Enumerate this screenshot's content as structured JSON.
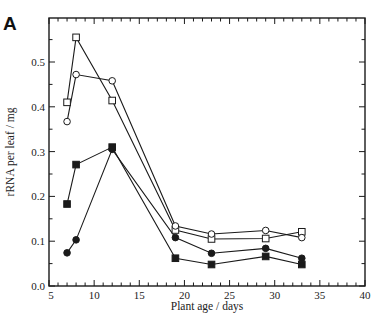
{
  "chart_data": {
    "type": "line",
    "panel_label": "A",
    "title": "",
    "xlabel": "Plant age / days",
    "ylabel": "rRNA per leaf / mg",
    "xlim": [
      5,
      40
    ],
    "ylim": [
      0.0,
      0.6
    ],
    "x_ticks": [
      5,
      10,
      15,
      20,
      25,
      30,
      35,
      40
    ],
    "y_ticks": [
      0.0,
      0.1,
      0.2,
      0.3,
      0.4,
      0.5
    ],
    "x_tick_labels": [
      "5",
      "10",
      "15",
      "20",
      "25",
      "30",
      "35",
      "40"
    ],
    "y_tick_labels": [
      "0.0",
      "0.1",
      "0.2",
      "0.3",
      "0.4",
      "0.5"
    ],
    "grid": false,
    "legend": null,
    "series": [
      {
        "name": "open squares",
        "marker": "square-open",
        "x": [
          7,
          8,
          12,
          19,
          23,
          29,
          33
        ],
        "values": [
          0.41,
          0.555,
          0.414,
          0.125,
          0.105,
          0.106,
          0.121
        ]
      },
      {
        "name": "open circles",
        "marker": "circle-open",
        "x": [
          7,
          8,
          12,
          19,
          23,
          29,
          33
        ],
        "values": [
          0.367,
          0.472,
          0.458,
          0.134,
          0.116,
          0.124,
          0.108
        ]
      },
      {
        "name": "filled squares",
        "marker": "square-filled",
        "x": [
          7,
          8,
          12,
          19,
          23,
          29,
          33
        ],
        "values": [
          0.183,
          0.271,
          0.31,
          0.062,
          0.048,
          0.066,
          0.048
        ]
      },
      {
        "name": "filled circles",
        "marker": "circle-filled",
        "x": [
          7,
          8,
          12,
          19,
          23,
          29,
          33
        ],
        "values": [
          0.074,
          0.103,
          0.305,
          0.108,
          0.073,
          0.084,
          0.062
        ]
      }
    ]
  },
  "colors": {
    "ink": "#1a1a1a",
    "background": "#ffffff"
  }
}
